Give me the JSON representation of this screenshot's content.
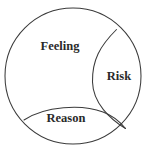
{
  "canvas": {
    "width": 146,
    "height": 153,
    "background_color": "#ffffff"
  },
  "diagram": {
    "type": "region-partition-circle",
    "stroke_color": "#3b3b3b",
    "stroke_width": 1.05,
    "fill_color": "none",
    "text_color": "#2a2a2a",
    "outer_circle": {
      "cx": 73,
      "cy": 76,
      "r": 68
    },
    "regions": [
      {
        "id": "feeling",
        "label": "Feeling",
        "label_x": 60,
        "label_y": 47,
        "font_size": 12.5
      },
      {
        "id": "risk",
        "label": "Risk",
        "label_x": 119,
        "label_y": 77,
        "font_size": 12.5
      },
      {
        "id": "reason",
        "label": "Reason",
        "label_x": 66,
        "label_y": 119,
        "font_size": 12.5
      }
    ],
    "dividers": [
      {
        "id": "risk-arc",
        "description": "arc from upper-right circle edge curving left then down to lower-right circle edge, bounding the Risk lens",
        "path": "M 116.5 29.5 C 100 46 92 60 92.5 82 C 93 103 110 119 125.5 128.5"
      },
      {
        "id": "reason-arc",
        "description": "arc from left circle edge curving right and slightly down to lower-right circle edge, bounding the Reason lens",
        "path": "M 24 120 C 45 106 82 104 103 112 C 114 116 121 123 125.5 128.5"
      }
    ]
  }
}
